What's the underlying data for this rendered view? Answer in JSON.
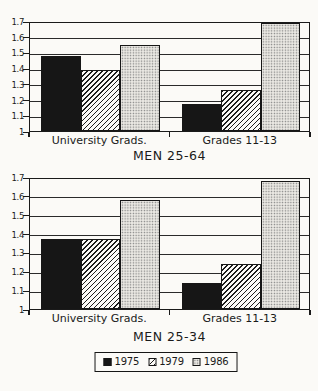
{
  "page": {
    "background": "#fbfaf7",
    "ink": "#1a1a1a"
  },
  "chart_data": [
    {
      "type": "bar",
      "title": "MEN 25-64",
      "categories": [
        "University Grads.",
        "Grades 11-13"
      ],
      "series": [
        {
          "name": "1975",
          "values": [
            1.48,
            1.17
          ]
        },
        {
          "name": "1979",
          "values": [
            1.39,
            1.26
          ]
        },
        {
          "name": "1986",
          "values": [
            1.55,
            1.69
          ]
        }
      ],
      "ylim": [
        1,
        1.7
      ],
      "ytick_labels": [
        "1.7",
        "1.6",
        "1.5",
        "1.4",
        "1.3",
        "1.2",
        "1.1",
        "1"
      ],
      "grid": true,
      "legend_position": "shared-bottom"
    },
    {
      "type": "bar",
      "title": "MEN 25-34",
      "categories": [
        "University Grads.",
        "Grades 11-13"
      ],
      "series": [
        {
          "name": "1975",
          "values": [
            1.37,
            1.14
          ]
        },
        {
          "name": "1979",
          "values": [
            1.37,
            1.24
          ]
        },
        {
          "name": "1986",
          "values": [
            1.58,
            1.68
          ]
        }
      ],
      "ylim": [
        1,
        1.7
      ],
      "ytick_labels": [
        "1.7",
        "1.6",
        "1.5",
        "1.4",
        "1.3",
        "1.2",
        "1.1",
        "1"
      ],
      "grid": true,
      "legend_position": "shared-bottom"
    }
  ],
  "legend": {
    "items": [
      {
        "label": "1975",
        "pattern": "solid-black"
      },
      {
        "label": "1979",
        "pattern": "diagonal-hatch"
      },
      {
        "label": "1986",
        "pattern": "dot-stipple"
      }
    ]
  },
  "colors": {
    "bar_1975": "#161616",
    "hatch_line": "#1c1c1c",
    "stipple_bg": "#eae8e3",
    "stipple_dot": "#7d7d7d"
  }
}
